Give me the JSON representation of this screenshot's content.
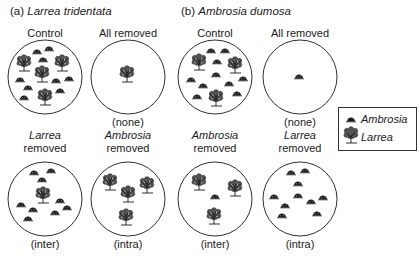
{
  "panels": [
    {
      "prefix": "(a)",
      "species": "Larrea tridentata",
      "treatments": [
        {
          "top": "Control",
          "italic": "",
          "bottom": ""
        },
        {
          "top": "All removed",
          "italic": "",
          "bottom": "(none)"
        },
        {
          "top": "removed",
          "italic": "Larrea",
          "bottom": "(inter)"
        },
        {
          "top": "removed",
          "italic": "Ambrosia",
          "bottom": "(intra)"
        }
      ]
    },
    {
      "prefix": "(b)",
      "species": "Ambrosia dumosa",
      "treatments": [
        {
          "top": "Control",
          "italic": "",
          "bottom": ""
        },
        {
          "top": "All removed",
          "italic": "",
          "bottom": "(none)"
        },
        {
          "top": "removed",
          "italic": "Ambrosia",
          "bottom": "(inter)"
        },
        {
          "top": "removed",
          "italic": "Larrea",
          "bottom": "(intra)"
        }
      ]
    }
  ],
  "legend": {
    "items": [
      {
        "icon": "ambrosia-shrub-icon",
        "label": "Ambrosia"
      },
      {
        "icon": "larrea-shrub-icon",
        "label": "Larrea"
      }
    ]
  },
  "colors": {
    "ink": "#1a1a1a",
    "background": "#ffffff"
  }
}
